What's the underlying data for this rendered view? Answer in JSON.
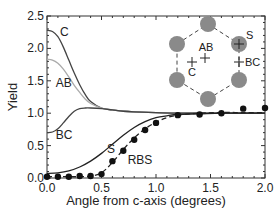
{
  "chart_data": {
    "type": "line",
    "title": "",
    "xlabel": "Angle from c-axis (degrees)",
    "ylabel": "Yield",
    "xlim": [
      0.0,
      2.0
    ],
    "ylim": [
      0.0,
      2.5
    ],
    "xticks": [
      0.0,
      0.5,
      1.0,
      1.5,
      2.0
    ],
    "xtick_labels": [
      "0.0",
      "0.5",
      "1.0",
      "1.5",
      "2.0"
    ],
    "yticks": [
      0.0,
      0.5,
      1.0,
      1.5,
      2.0,
      2.5
    ],
    "ytick_labels": [
      "0.0",
      "0.5",
      "1.0",
      "1.5",
      "2.0",
      "2.5"
    ],
    "grid": false,
    "legend": "inline labels",
    "series": [
      {
        "name": "C",
        "style": "solid",
        "color": "#444444",
        "x": [
          0.0,
          0.05,
          0.1,
          0.15,
          0.2,
          0.25,
          0.3,
          0.35,
          0.4,
          0.5,
          0.6,
          0.7,
          0.8,
          1.0,
          1.2,
          1.5,
          2.0
        ],
        "y": [
          2.28,
          2.26,
          2.18,
          2.02,
          1.82,
          1.62,
          1.44,
          1.29,
          1.18,
          1.08,
          1.05,
          1.03,
          1.02,
          1.01,
          1.0,
          1.0,
          1.0
        ],
        "label_pos": [
          0.12,
          2.25
        ]
      },
      {
        "name": "AB",
        "style": "solid",
        "color": "#aaaaaa",
        "x": [
          0.0,
          0.05,
          0.1,
          0.15,
          0.2,
          0.25,
          0.3,
          0.35,
          0.4,
          0.5,
          0.6,
          0.7,
          0.8,
          1.0,
          1.2,
          1.5,
          2.0
        ],
        "y": [
          1.83,
          1.82,
          1.77,
          1.68,
          1.56,
          1.43,
          1.32,
          1.22,
          1.15,
          1.08,
          1.05,
          1.03,
          1.02,
          1.01,
          1.0,
          1.0,
          1.0
        ],
        "label_pos": [
          0.08,
          1.46
        ]
      },
      {
        "name": "BC",
        "style": "solid",
        "color": "#444444",
        "x": [
          0.0,
          0.05,
          0.1,
          0.15,
          0.2,
          0.25,
          0.3,
          0.35,
          0.4,
          0.5,
          0.6,
          0.7,
          0.8,
          1.0,
          1.2,
          1.5,
          2.0
        ],
        "y": [
          0.7,
          0.71,
          0.76,
          0.85,
          0.95,
          1.03,
          1.07,
          1.08,
          1.08,
          1.07,
          1.05,
          1.03,
          1.02,
          1.01,
          1.0,
          1.0,
          1.0
        ],
        "label_pos": [
          0.08,
          0.66
        ]
      },
      {
        "name": "S",
        "style": "solid",
        "color": "#222222",
        "x": [
          0.0,
          0.1,
          0.2,
          0.3,
          0.4,
          0.5,
          0.6,
          0.7,
          0.8,
          0.9,
          1.0,
          1.1,
          1.2,
          1.4,
          1.6,
          1.8,
          2.0
        ],
        "y": [
          0.07,
          0.08,
          0.11,
          0.17,
          0.26,
          0.38,
          0.52,
          0.66,
          0.78,
          0.87,
          0.93,
          0.96,
          0.98,
          0.99,
          1.0,
          1.0,
          1.0
        ],
        "label_pos": [
          0.55,
          0.44
        ]
      },
      {
        "name": "RBS",
        "style": "dashed",
        "color": "#222222",
        "x": [
          0.0,
          0.1,
          0.2,
          0.3,
          0.4,
          0.5,
          0.6,
          0.7,
          0.8,
          0.9,
          1.0,
          1.1,
          1.2,
          1.4,
          1.6,
          1.8,
          2.0
        ],
        "y": [
          0.02,
          0.02,
          0.02,
          0.02,
          0.03,
          0.08,
          0.24,
          0.44,
          0.62,
          0.76,
          0.86,
          0.93,
          0.97,
          1.0,
          1.01,
          1.01,
          1.01
        ],
        "label_pos": [
          0.74,
          0.28
        ]
      },
      {
        "name": "RBS data",
        "style": "markers",
        "color": "#111111",
        "x": [
          0.0,
          0.1,
          0.2,
          0.3,
          0.4,
          0.5,
          0.6,
          0.7,
          0.8,
          0.9,
          1.0,
          1.2,
          1.4,
          1.6,
          1.8,
          2.0
        ],
        "y": [
          0.02,
          0.02,
          0.02,
          0.03,
          0.03,
          0.06,
          0.26,
          0.42,
          0.59,
          0.74,
          0.85,
          0.97,
          0.98,
          1.0,
          1.07,
          1.08
        ]
      }
    ],
    "inset": {
      "type": "hexagon-lattice-diagram",
      "atom_color": "#8a8a8a",
      "labels": [
        "AB",
        "C",
        "S",
        "BC"
      ]
    }
  }
}
